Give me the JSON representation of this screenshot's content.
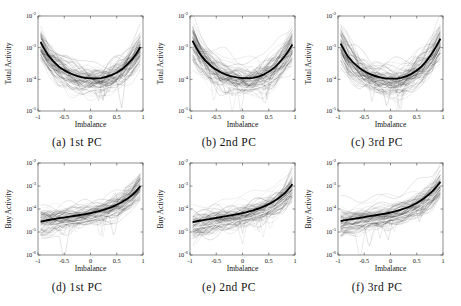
{
  "figure": {
    "background": "#ffffff",
    "rows": 2,
    "cols": 3,
    "text_color": "#111111",
    "axis_color": "#444444",
    "curve_color": "#000000",
    "median_color": "#ffffff"
  },
  "chart_data": [
    {
      "type": "line",
      "caption": "(a) 1st PC",
      "xlabel": "Imbalance",
      "ylabel": "Total Activity",
      "xlim": [
        -1,
        1
      ],
      "x_ticks": [
        -1,
        -0.5,
        0,
        0.5,
        1
      ],
      "y_scale": "log",
      "y_tick_exponents": [
        -2,
        -3,
        -4,
        -5
      ],
      "grid": false,
      "series": [
        {
          "name": "mean",
          "color": "#000000",
          "width": 1.8,
          "x": [
            -0.95,
            -0.8,
            -0.6,
            -0.4,
            -0.2,
            0,
            0.2,
            0.4,
            0.6,
            0.8,
            0.95
          ],
          "log10y": [
            -2.82,
            -3.25,
            -3.6,
            -3.8,
            -3.92,
            -3.97,
            -3.96,
            -3.87,
            -3.68,
            -3.35,
            -2.98
          ]
        },
        {
          "name": "median",
          "color": "#ffffff",
          "width": 0.9,
          "x": [
            -0.95,
            -0.8,
            -0.6,
            -0.4,
            -0.2,
            0,
            0.2,
            0.4,
            0.6,
            0.8,
            0.95
          ],
          "log10y": [
            -3.15,
            -3.58,
            -3.93,
            -4.13,
            -4.25,
            -4.3,
            -4.29,
            -4.2,
            -4.01,
            -3.68,
            -3.31
          ]
        }
      ],
      "ensemble": {
        "name": "individual-stock-curves",
        "count": 85,
        "color": "#000000",
        "spread_decades": 0.42,
        "seed": 11
      }
    },
    {
      "type": "line",
      "caption": "(b) 2nd PC",
      "xlabel": "Imbalance",
      "ylabel": "Total Activity",
      "xlim": [
        -1,
        1
      ],
      "x_ticks": [
        -1,
        -0.5,
        0,
        0.5,
        1
      ],
      "y_scale": "log",
      "y_tick_exponents": [
        -2,
        -3,
        -4,
        -5
      ],
      "grid": false,
      "series": [
        {
          "name": "mean",
          "color": "#000000",
          "width": 1.8,
          "x": [
            -0.95,
            -0.8,
            -0.6,
            -0.4,
            -0.2,
            0,
            0.2,
            0.4,
            0.6,
            0.8,
            0.95
          ],
          "log10y": [
            -2.78,
            -3.22,
            -3.58,
            -3.79,
            -3.91,
            -3.96,
            -3.95,
            -3.85,
            -3.64,
            -3.28,
            -2.9
          ]
        },
        {
          "name": "median",
          "color": "#ffffff",
          "width": 0.9,
          "x": [
            -0.95,
            -0.8,
            -0.6,
            -0.4,
            -0.2,
            0,
            0.2,
            0.4,
            0.6,
            0.8,
            0.95
          ],
          "log10y": [
            -3.11,
            -3.55,
            -3.91,
            -4.12,
            -4.24,
            -4.29,
            -4.28,
            -4.18,
            -3.97,
            -3.61,
            -3.23
          ]
        }
      ],
      "ensemble": {
        "name": "individual-stock-curves",
        "count": 85,
        "color": "#000000",
        "spread_decades": 0.42,
        "seed": 22
      }
    },
    {
      "type": "line",
      "caption": "(c) 3rd PC",
      "xlabel": "Imbalance",
      "ylabel": "Total Activity",
      "xlim": [
        -1,
        1
      ],
      "x_ticks": [
        -1,
        -0.5,
        0,
        0.5,
        1
      ],
      "y_scale": "log",
      "y_tick_exponents": [
        -2,
        -3,
        -4,
        -5
      ],
      "grid": false,
      "series": [
        {
          "name": "mean",
          "color": "#000000",
          "width": 1.8,
          "x": [
            -0.95,
            -0.8,
            -0.6,
            -0.4,
            -0.2,
            0,
            0.2,
            0.4,
            0.6,
            0.8,
            0.95
          ],
          "log10y": [
            -2.87,
            -3.3,
            -3.63,
            -3.83,
            -3.94,
            -3.98,
            -3.95,
            -3.83,
            -3.58,
            -3.15,
            -2.72
          ]
        },
        {
          "name": "median",
          "color": "#ffffff",
          "width": 0.9,
          "x": [
            -0.95,
            -0.8,
            -0.6,
            -0.4,
            -0.2,
            0,
            0.2,
            0.4,
            0.6,
            0.8,
            0.95
          ],
          "log10y": [
            -3.2,
            -3.63,
            -3.96,
            -4.16,
            -4.27,
            -4.31,
            -4.28,
            -4.16,
            -3.91,
            -3.48,
            -3.05
          ]
        }
      ],
      "ensemble": {
        "name": "individual-stock-curves",
        "count": 85,
        "color": "#000000",
        "spread_decades": 0.42,
        "seed": 33
      }
    },
    {
      "type": "line",
      "caption": "(d) 1st PC",
      "xlabel": "Imbalance",
      "ylabel": "Buy Activity",
      "xlim": [
        -1,
        1
      ],
      "x_ticks": [
        -1,
        -0.5,
        0,
        0.5,
        1
      ],
      "y_scale": "log",
      "y_tick_exponents": [
        -2,
        -3,
        -4,
        -5,
        -6
      ],
      "grid": false,
      "series": [
        {
          "name": "mean",
          "color": "#000000",
          "width": 1.8,
          "x": [
            -0.95,
            -0.8,
            -0.6,
            -0.4,
            -0.2,
            0,
            0.2,
            0.4,
            0.6,
            0.8,
            0.95
          ],
          "log10y": [
            -4.55,
            -4.48,
            -4.4,
            -4.33,
            -4.26,
            -4.18,
            -4.07,
            -3.92,
            -3.7,
            -3.38,
            -3.0
          ]
        },
        {
          "name": "median",
          "color": "#ffffff",
          "width": 0.9,
          "x": [
            -0.95,
            -0.8,
            -0.6,
            -0.4,
            -0.2,
            0,
            0.2,
            0.4,
            0.6,
            0.8,
            0.95
          ],
          "log10y": [
            -4.83,
            -4.76,
            -4.68,
            -4.61,
            -4.54,
            -4.46,
            -4.35,
            -4.2,
            -3.98,
            -3.66,
            -3.28
          ]
        }
      ],
      "ensemble": {
        "name": "individual-stock-curves",
        "count": 85,
        "color": "#000000",
        "spread_decades": 0.45,
        "seed": 44
      }
    },
    {
      "type": "line",
      "caption": "(e) 2nd PC",
      "xlabel": "Imbalance",
      "ylabel": "Buy Activity",
      "xlim": [
        -1,
        1
      ],
      "x_ticks": [
        -1,
        -0.5,
        0,
        0.5,
        1
      ],
      "y_scale": "log",
      "y_tick_exponents": [
        -2,
        -3,
        -4,
        -5,
        -6
      ],
      "grid": false,
      "series": [
        {
          "name": "mean",
          "color": "#000000",
          "width": 1.8,
          "x": [
            -0.95,
            -0.8,
            -0.6,
            -0.4,
            -0.2,
            0,
            0.2,
            0.4,
            0.6,
            0.8,
            0.95
          ],
          "log10y": [
            -4.57,
            -4.5,
            -4.43,
            -4.35,
            -4.27,
            -4.18,
            -4.06,
            -3.9,
            -3.66,
            -3.32,
            -2.92
          ]
        },
        {
          "name": "median",
          "color": "#ffffff",
          "width": 0.9,
          "x": [
            -0.95,
            -0.8,
            -0.6,
            -0.4,
            -0.2,
            0,
            0.2,
            0.4,
            0.6,
            0.8,
            0.95
          ],
          "log10y": [
            -4.85,
            -4.78,
            -4.71,
            -4.63,
            -4.55,
            -4.46,
            -4.34,
            -4.18,
            -3.94,
            -3.6,
            -3.2
          ]
        }
      ],
      "ensemble": {
        "name": "individual-stock-curves",
        "count": 85,
        "color": "#000000",
        "spread_decades": 0.45,
        "seed": 55
      }
    },
    {
      "type": "line",
      "caption": "(f) 3rd PC",
      "xlabel": "Imbalance",
      "ylabel": "Buy Activity",
      "xlim": [
        -1,
        1
      ],
      "x_ticks": [
        -1,
        -0.5,
        0,
        0.5,
        1
      ],
      "y_scale": "log",
      "y_tick_exponents": [
        -2,
        -3,
        -4,
        -5,
        -6
      ],
      "grid": false,
      "series": [
        {
          "name": "mean",
          "color": "#000000",
          "width": 1.8,
          "x": [
            -0.95,
            -0.8,
            -0.6,
            -0.4,
            -0.2,
            0,
            0.2,
            0.4,
            0.6,
            0.8,
            0.95
          ],
          "log10y": [
            -4.52,
            -4.46,
            -4.39,
            -4.31,
            -4.24,
            -4.15,
            -4.03,
            -3.86,
            -3.6,
            -3.22,
            -2.82
          ]
        },
        {
          "name": "median",
          "color": "#ffffff",
          "width": 0.9,
          "x": [
            -0.95,
            -0.8,
            -0.6,
            -0.4,
            -0.2,
            0,
            0.2,
            0.4,
            0.6,
            0.8,
            0.95
          ],
          "log10y": [
            -4.8,
            -4.74,
            -4.67,
            -4.59,
            -4.52,
            -4.43,
            -4.31,
            -4.14,
            -3.88,
            -3.5,
            -3.1
          ]
        }
      ],
      "ensemble": {
        "name": "individual-stock-curves",
        "count": 85,
        "color": "#000000",
        "spread_decades": 0.45,
        "seed": 66
      }
    }
  ]
}
